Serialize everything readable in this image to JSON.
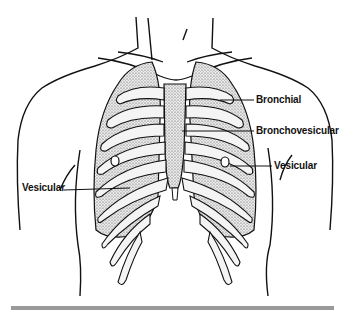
{
  "figure": {
    "labels": [
      {
        "id": "bronchial",
        "text": "Bronchial"
      },
      {
        "id": "bronchovesicular",
        "text": "Bronchovesicular"
      },
      {
        "id": "vesicular-right",
        "text": "Vesicular"
      },
      {
        "id": "vesicular-left",
        "text": "Vesicular"
      }
    ]
  },
  "colors": {
    "line": "#111111",
    "stipple": "#bdbdbd",
    "divider": "#9a9a9a"
  }
}
